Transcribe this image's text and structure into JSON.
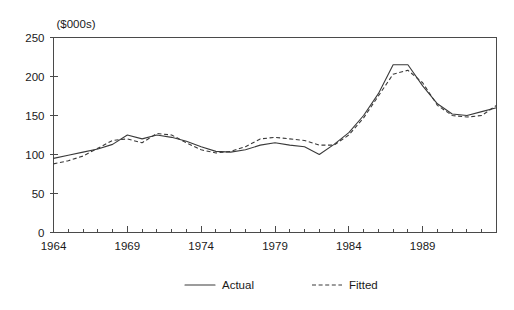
{
  "chart_data": {
    "type": "line",
    "title": "",
    "xlabel": "",
    "ylabel": "($000s)",
    "ylabel_position": "top-left",
    "xlim": [
      1964,
      1994
    ],
    "ylim": [
      0,
      250
    ],
    "yticks": [
      0,
      50,
      100,
      150,
      200,
      250
    ],
    "xticks_major": [
      1964,
      1969,
      1974,
      1979,
      1984,
      1989
    ],
    "xticks_minor_interval": 1,
    "grid": false,
    "legend_position": "bottom-center",
    "x": [
      1964,
      1965,
      1966,
      1967,
      1968,
      1969,
      1970,
      1971,
      1972,
      1973,
      1974,
      1975,
      1976,
      1977,
      1978,
      1979,
      1980,
      1981,
      1982,
      1983,
      1984,
      1985,
      1986,
      1987,
      1988,
      1989,
      1990,
      1991,
      1992,
      1993,
      1994
    ],
    "series": [
      {
        "name": "Actual",
        "style": "solid",
        "values": [
          95,
          99,
          103,
          107,
          113,
          125,
          120,
          125,
          122,
          117,
          110,
          104,
          103,
          106,
          112,
          115,
          112,
          110,
          100,
          113,
          128,
          150,
          178,
          215,
          215,
          188,
          165,
          152,
          150,
          155,
          160
        ]
      },
      {
        "name": "Fitted",
        "style": "dashed",
        "values": [
          88,
          92,
          98,
          108,
          118,
          120,
          115,
          127,
          125,
          115,
          106,
          102,
          104,
          110,
          120,
          122,
          120,
          118,
          112,
          112,
          125,
          147,
          175,
          203,
          208,
          192,
          163,
          150,
          148,
          150,
          163
        ]
      }
    ]
  },
  "legend": {
    "items": [
      {
        "label": "Actual",
        "style": "solid"
      },
      {
        "label": "Fitted",
        "style": "dashed"
      }
    ]
  }
}
